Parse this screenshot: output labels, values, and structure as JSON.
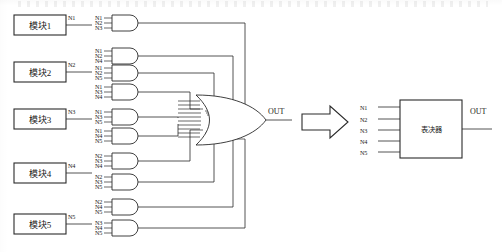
{
  "figure": {
    "title_strip": "",
    "left_diagram_name": "gate-level-majority-voter",
    "right_diagram_name": "block-level-voter"
  },
  "modules": [
    {
      "label": "模块1",
      "out_signal": "N1"
    },
    {
      "label": "模块2",
      "out_signal": "N2"
    },
    {
      "label": "模块3",
      "out_signal": "N3"
    },
    {
      "label": "模块4",
      "out_signal": "N4"
    },
    {
      "label": "模块5",
      "out_signal": "N5"
    }
  ],
  "and_gates": [
    {
      "inputs": [
        "N1",
        "N2",
        "N3"
      ]
    },
    {
      "inputs": [
        "N1",
        "N2",
        "N4"
      ]
    },
    {
      "inputs": [
        "N1",
        "N2",
        "N5"
      ]
    },
    {
      "inputs": [
        "N1",
        "N3",
        "N4"
      ]
    },
    {
      "inputs": [
        "N1",
        "N3",
        "N5"
      ]
    },
    {
      "inputs": [
        "N1",
        "N4",
        "N5"
      ]
    },
    {
      "inputs": [
        "N2",
        "N3",
        "N4"
      ]
    },
    {
      "inputs": [
        "N2",
        "N3",
        "N5"
      ]
    },
    {
      "inputs": [
        "N2",
        "N4",
        "N5"
      ]
    },
    {
      "inputs": [
        "N3",
        "N4",
        "N5"
      ]
    }
  ],
  "or_gate": {
    "output_label": "OUT"
  },
  "arrow": {
    "direction": "right"
  },
  "voter_block": {
    "label": "表决器",
    "inputs": [
      "N1",
      "N2",
      "N3",
      "N4",
      "N5"
    ],
    "output_label": "OUT"
  },
  "colors": {
    "line": "#2a2a2a",
    "text": "#1a1a1a",
    "background": "#ffffff"
  }
}
